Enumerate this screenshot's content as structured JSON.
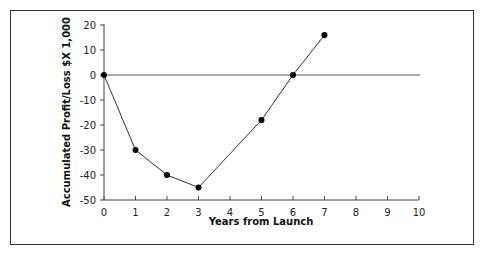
{
  "chart_data": {
    "type": "line",
    "title": "",
    "xlabel": "Years from Launch",
    "ylabel": "Accumulated Profit/Loss $X 1,000",
    "x": [
      0,
      1,
      2,
      3,
      5,
      6,
      7
    ],
    "series": [
      {
        "name": "Accumulated Profit/Loss",
        "values": [
          0,
          -30,
          -40,
          -45,
          -18,
          0,
          16
        ]
      }
    ],
    "xlim": [
      0,
      10
    ],
    "ylim": [
      -50,
      20
    ],
    "xticks": [
      "0",
      "1",
      "2",
      "3",
      "4",
      "5",
      "6",
      "7",
      "8",
      "9",
      "10"
    ],
    "yticks": [
      "20",
      "10",
      "0",
      "-10",
      "-20",
      "-30",
      "-40",
      "-50"
    ],
    "grid": false,
    "legend": null,
    "reference_line": {
      "y": 0,
      "x_from": 0,
      "x_to": 10
    }
  },
  "labels": {
    "xlabel": "Years from Launch",
    "ylabel": "Accumulated Profit/Loss $X 1,000",
    "xticks": [
      "0",
      "1",
      "2",
      "3",
      "4",
      "5",
      "6",
      "7",
      "8",
      "9",
      "10"
    ],
    "yticks": [
      "20",
      "10",
      "0",
      "-10",
      "-20",
      "-30",
      "-40",
      "-50"
    ]
  }
}
